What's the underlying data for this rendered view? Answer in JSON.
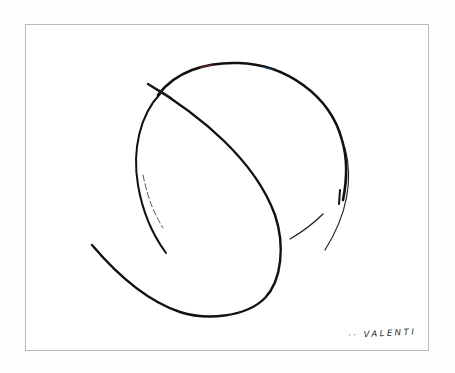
{
  "artwork": {
    "subject": "abstract sphere line drawing",
    "signature": "·· VALENTI",
    "stroke_color": "#111111",
    "accent_colors": [
      "#c0392b",
      "#2e86c1"
    ],
    "frame_border_color": "#b9b9b9",
    "background_color": "#ffffff"
  }
}
